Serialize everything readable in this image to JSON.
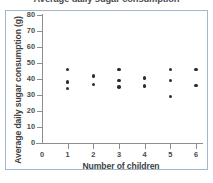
{
  "chart_data": {
    "type": "scatter",
    "title": "Average daily sugar consumption",
    "xlabel": "Number of children",
    "ylabel": "Average daily sugar consumption (g)",
    "xlim": [
      0,
      6
    ],
    "ylim": [
      0,
      80
    ],
    "xticks": [
      0,
      1,
      2,
      3,
      4,
      5,
      6
    ],
    "yticks": [
      0,
      10,
      20,
      30,
      40,
      50,
      60,
      70,
      80
    ],
    "grid": false,
    "legend": null,
    "marker_color": "#2b2b2b",
    "points": [
      {
        "x": 1,
        "y": 46
      },
      {
        "x": 1,
        "y": 38
      },
      {
        "x": 1,
        "y": 34
      },
      {
        "x": 2,
        "y": 42
      },
      {
        "x": 2,
        "y": 36.5
      },
      {
        "x": 3,
        "y": 46
      },
      {
        "x": 3,
        "y": 39
      },
      {
        "x": 3,
        "y": 35
      },
      {
        "x": 4,
        "y": 40.5
      },
      {
        "x": 4,
        "y": 35.5
      },
      {
        "x": 5,
        "y": 46
      },
      {
        "x": 5,
        "y": 39
      },
      {
        "x": 5,
        "y": 29
      },
      {
        "x": 6,
        "y": 46
      },
      {
        "x": 6,
        "y": 36
      }
    ]
  }
}
